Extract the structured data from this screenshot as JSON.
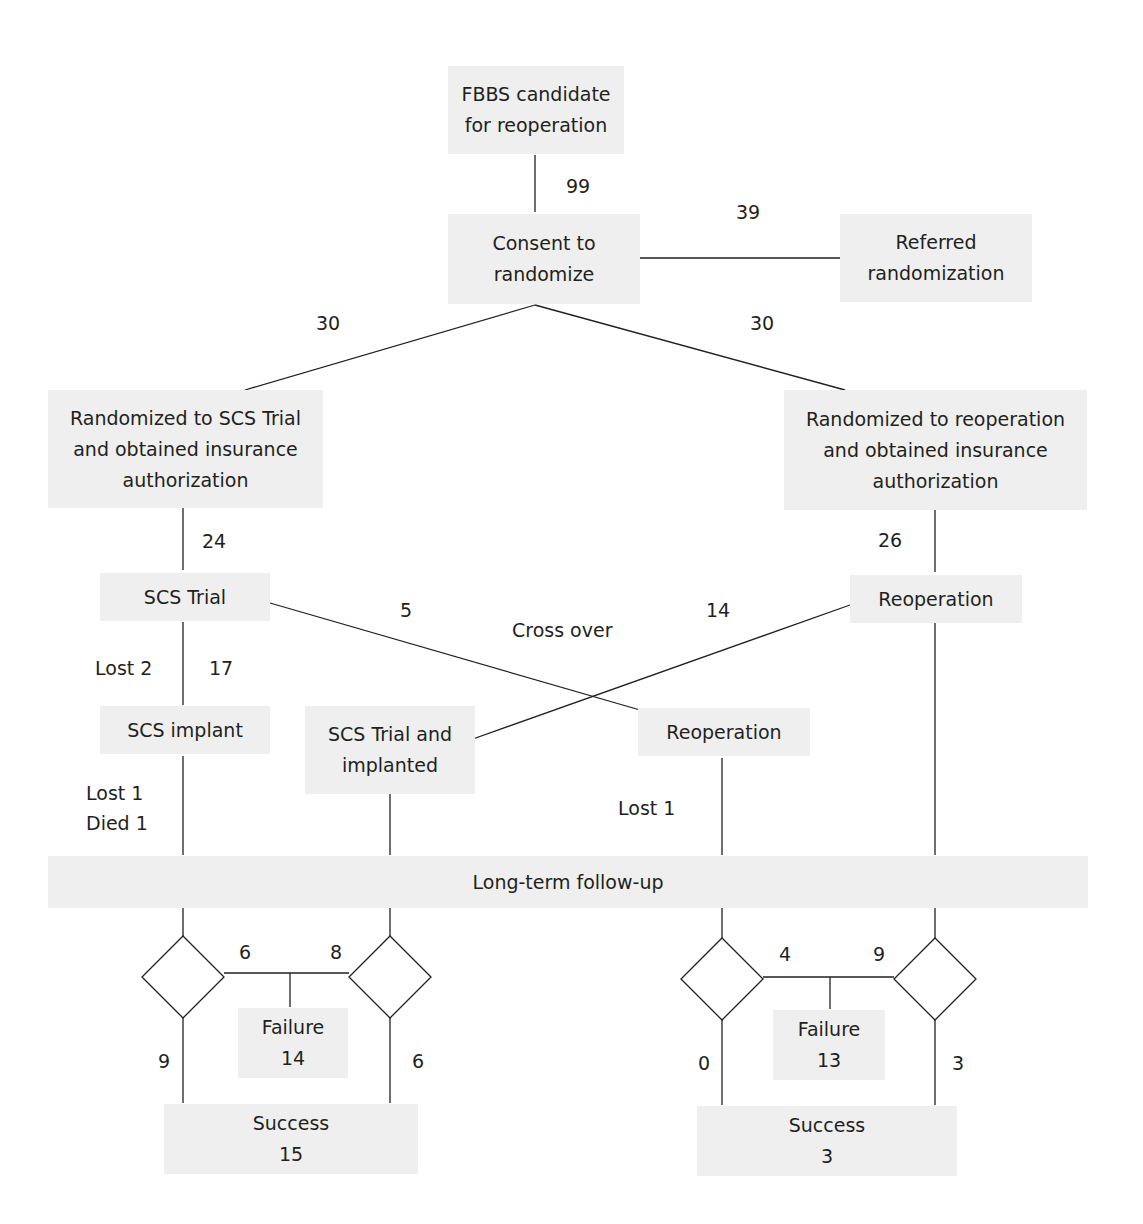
{
  "nodes": {
    "candidate": "FBBS candidate\nfor reoperation",
    "consent": "Consent to\nrandomize",
    "referred": "Referred\nrandomization",
    "rand_scs": "Randomized to SCS Trial\nand obtained insurance\nauthorization",
    "rand_reop": "Randomized to reoperation\nand obtained insurance\nauthorization",
    "scs_trial": "SCS Trial",
    "reoperation_right": "Reoperation",
    "scs_implant": "SCS implant",
    "scs_trial_implanted": "SCS Trial and\nimplanted",
    "reoperation_cross": "Reoperation",
    "followup": "Long-term follow-up",
    "failure_left": "Failure\n14",
    "success_left": "Success\n15",
    "failure_right": "Failure\n13",
    "success_right": "Success\n3"
  },
  "edge_labels": {
    "candidate_to_consent": "99",
    "consent_to_referred": "39",
    "consent_to_scs": "30",
    "consent_to_reop": "30",
    "rand_scs_to_trial": "24",
    "rand_reop_to_reop": "26",
    "cross_scs_to_reop": "5",
    "cross_reop_to_scs": "14",
    "cross_over": "Cross over",
    "trial_lost": "Lost 2",
    "trial_to_implant": "17",
    "implant_lost": "Lost 1",
    "implant_died": "Died 1",
    "cross_reop_lost": "Lost 1",
    "left_d1_fail": "6",
    "left_d2_fail": "8",
    "left_d1_success": "9",
    "left_d2_success": "6",
    "right_d1_fail": "4",
    "right_d2_fail": "9",
    "right_d1_success": "0",
    "right_d2_success": "3"
  }
}
